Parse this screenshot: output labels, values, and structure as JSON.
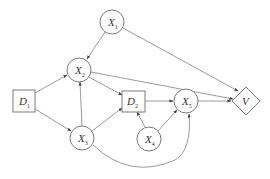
{
  "diagram": {
    "type": "influence-diagram",
    "colors": {
      "stroke": "#7a7a7a",
      "edge": "#808080",
      "text": "#333333",
      "background": "#ffffff"
    },
    "nodes": [
      {
        "id": "X1",
        "shape": "circle",
        "label": "X",
        "sub": "1",
        "cx": 112,
        "cy": 22
      },
      {
        "id": "X2",
        "shape": "circle",
        "label": "X",
        "sub": "2",
        "cx": 79,
        "cy": 70
      },
      {
        "id": "D1",
        "shape": "square",
        "label": "D",
        "sub": "1",
        "cx": 24,
        "cy": 101
      },
      {
        "id": "X3",
        "shape": "circle",
        "label": "X",
        "sub": "3",
        "cx": 82,
        "cy": 138
      },
      {
        "id": "D2",
        "shape": "square",
        "label": "D",
        "sub": "2",
        "cx": 133,
        "cy": 101
      },
      {
        "id": "X5",
        "shape": "circle",
        "label": "X",
        "sub": "5",
        "cx": 186,
        "cy": 101
      },
      {
        "id": "X4",
        "shape": "circle",
        "label": "X",
        "sub": "4",
        "cx": 149,
        "cy": 139
      },
      {
        "id": "V",
        "shape": "diamond",
        "label": "V",
        "sub": "",
        "cx": 246,
        "cy": 101
      }
    ],
    "edges": [
      {
        "from": "X1",
        "to": "X2"
      },
      {
        "from": "X1",
        "to": "V"
      },
      {
        "from": "X2",
        "to": "D2"
      },
      {
        "from": "X2",
        "to": "V"
      },
      {
        "from": "D1",
        "to": "X2"
      },
      {
        "from": "D1",
        "to": "X3"
      },
      {
        "from": "X3",
        "to": "X2"
      },
      {
        "from": "X3",
        "to": "D2"
      },
      {
        "from": "D2",
        "to": "X5"
      },
      {
        "from": "X4",
        "to": "D2"
      },
      {
        "from": "X4",
        "to": "X5"
      },
      {
        "from": "X3",
        "to": "X5",
        "curved": true
      },
      {
        "from": "X5",
        "to": "V"
      }
    ]
  }
}
